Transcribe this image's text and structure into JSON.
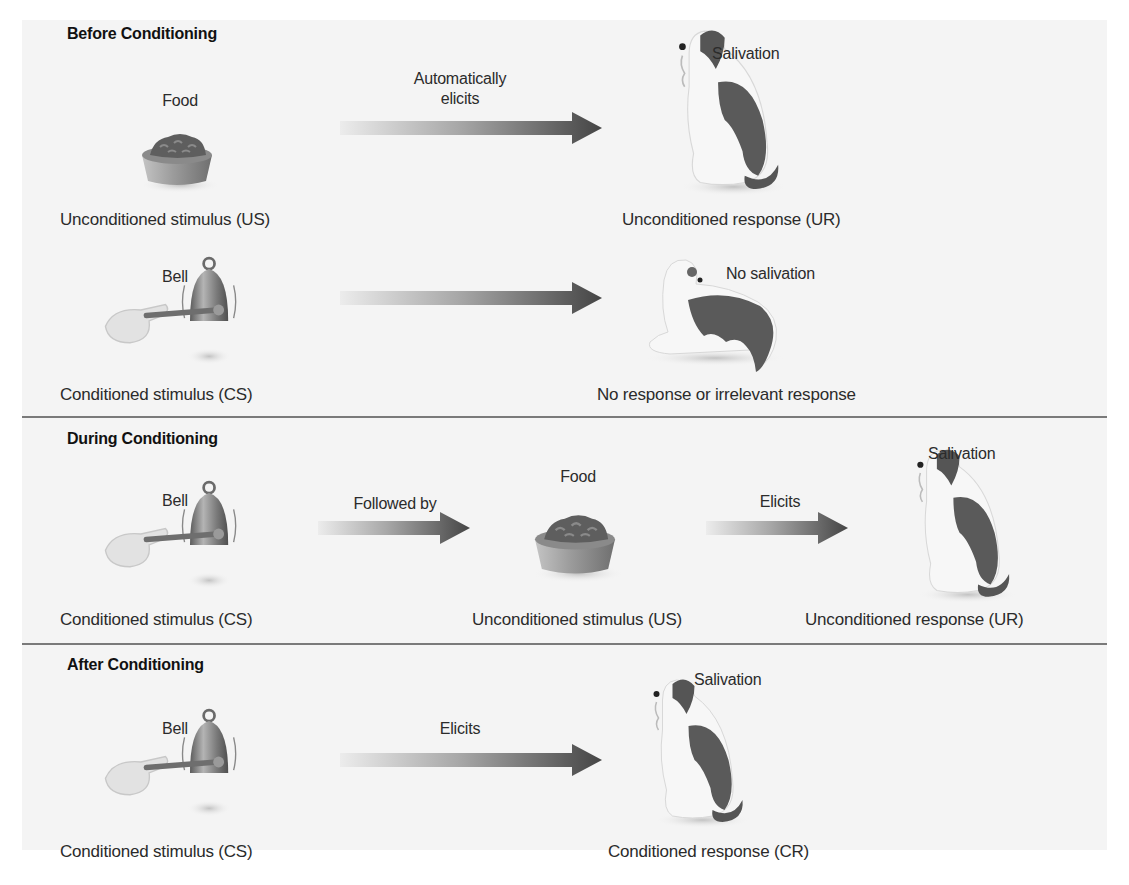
{
  "figure": {
    "colors": {
      "background": "#f4f4f4",
      "divider": "#7a7a7a",
      "arrow_start": "#e6e6e6",
      "arrow_end": "#4a4a4a",
      "dog_patch": "#5a5a5a",
      "bowl": "#9a9a9a",
      "bell": "#7d7d7d"
    }
  },
  "sections": [
    {
      "title": "Before Conditioning",
      "rows": [
        {
          "stimulus": {
            "icon": "food-bowl-icon",
            "label": "Food",
            "caption": "Unconditioned stimulus (US)"
          },
          "arrow_label_line1": "Automatically",
          "arrow_label_line2": "elicits",
          "response": {
            "icon": "salivating-dog-icon",
            "label": "Salivation",
            "caption": "Unconditioned response (UR)"
          }
        },
        {
          "stimulus": {
            "icon": "bell-icon",
            "label": "Bell",
            "caption": "Conditioned stimulus (CS)"
          },
          "arrow_label_line1": "",
          "arrow_label_line2": "",
          "response": {
            "icon": "lying-dog-icon",
            "label": "No salivation",
            "caption": "No response or irrelevant response"
          }
        }
      ]
    },
    {
      "title": "During Conditioning",
      "rows": [
        {
          "stimulus": {
            "icon": "bell-icon",
            "label": "Bell",
            "caption": "Conditioned stimulus (CS)"
          },
          "arrow1_label": "Followed by",
          "middle": {
            "icon": "food-bowl-icon",
            "label": "Food",
            "caption": "Unconditioned stimulus (US)"
          },
          "arrow2_label": "Elicits",
          "response": {
            "icon": "salivating-dog-icon",
            "label": "Salivation",
            "caption": "Unconditioned response (UR)"
          }
        }
      ]
    },
    {
      "title": "After Conditioning",
      "rows": [
        {
          "stimulus": {
            "icon": "bell-icon",
            "label": "Bell",
            "caption": "Conditioned stimulus (CS)"
          },
          "arrow_label": "Elicits",
          "response": {
            "icon": "salivating-dog-icon",
            "label": "Salivation",
            "caption": "Conditioned response (CR)"
          }
        }
      ]
    }
  ]
}
